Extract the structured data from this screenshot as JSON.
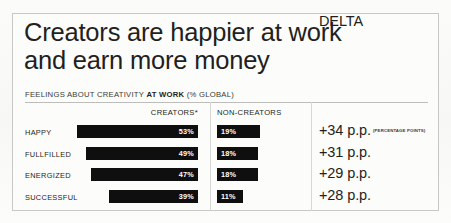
{
  "title": {
    "line1": "Creators are happier at work",
    "line2": "and earn more money"
  },
  "subtitle": {
    "prefix": "FEELINGS ABOUT CREATIVITY ",
    "emphasis": "AT WORK",
    "suffix": " (% GLOBAL)"
  },
  "columns": {
    "creators": "CREATORS*",
    "non_creators": "NON-CREATORS",
    "delta": "DELTA"
  },
  "rows": [
    {
      "label": "HAPPY",
      "creators_value": "53%",
      "non_creators_value": "19%",
      "delta": "+34 p.p.",
      "delta_note": "(PERCENTAGE POINTS)"
    },
    {
      "label": "FULLFILLED",
      "creators_value": "49%",
      "non_creators_value": "18%",
      "delta": "+31 p.p.",
      "delta_note": ""
    },
    {
      "label": "ENERGIZED",
      "creators_value": "47%",
      "non_creators_value": "18%",
      "delta": "+29 p.p.",
      "delta_note": ""
    },
    {
      "label": "SUCCESSFUL",
      "creators_value": "39%",
      "non_creators_value": "11%",
      "delta": "+28 p.p.",
      "delta_note": ""
    }
  ],
  "colors": {
    "bar": "#100f0f",
    "text": "#231f20",
    "frame": "#c8c8c6",
    "divider": "#d6d6d4",
    "background": "#fcfcfb"
  },
  "chart_data": {
    "type": "bar",
    "title": "Creators are happier at work and earn more money",
    "subtitle": "FEELINGS ABOUT CREATIVITY AT WORK (% GLOBAL)",
    "categories": [
      "HAPPY",
      "FULLFILLED",
      "ENERGIZED",
      "SUCCESSFUL"
    ],
    "series": [
      {
        "name": "CREATORS*",
        "values": [
          53,
          49,
          47,
          39
        ],
        "align": "right"
      },
      {
        "name": "NON-CREATORS",
        "values": [
          19,
          18,
          18,
          11
        ],
        "align": "left"
      }
    ],
    "delta": {
      "name": "DELTA",
      "values": [
        34,
        31,
        29,
        28
      ],
      "unit": "p.p.",
      "unit_expanded": "PERCENTAGE POINTS",
      "labels": [
        "+34 p.p.",
        "+31 p.p.",
        "+29 p.p.",
        "+28 p.p."
      ]
    },
    "xlabel": "",
    "ylabel": "",
    "xlim": [
      0,
      60
    ],
    "grid": false,
    "legend": "column-headers",
    "orientation": "horizontal",
    "footnote_marker": "*"
  }
}
